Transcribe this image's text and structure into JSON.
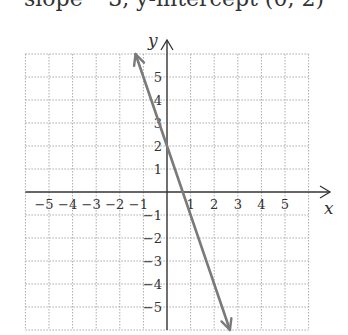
{
  "header": {
    "cropped_text": "slope −3, y-intercept (0, 2)"
  },
  "colors": {
    "grid": "#aaaaaa",
    "axis": "#333333",
    "line": "#7a7a7a",
    "label": "#333333"
  },
  "chart_data": {
    "type": "line",
    "title": "",
    "xlabel": "x",
    "ylabel": "y",
    "xlim": [
      -6,
      6
    ],
    "ylim": [
      -6,
      6
    ],
    "grid": true,
    "x_ticks": [
      -5,
      -4,
      -3,
      -2,
      -1,
      1,
      2,
      3,
      4,
      5
    ],
    "y_ticks": [
      -5,
      -4,
      -3,
      -2,
      -1,
      1,
      2,
      3,
      4,
      5
    ],
    "series": [
      {
        "name": "y = -3x + 2",
        "slope": -3,
        "intercept": 2,
        "x": [
          -1.333,
          2.667
        ],
        "y": [
          6,
          -6
        ],
        "arrows_both_ends": true
      }
    ]
  }
}
